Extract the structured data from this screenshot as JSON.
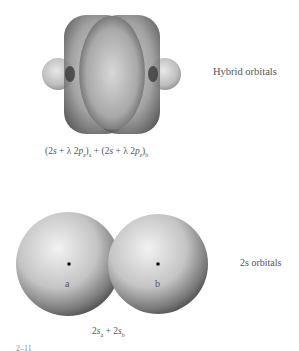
{
  "hybrid": {
    "label": "Hybrid orbitals",
    "formula": {
      "part1": "(2",
      "s1": "s",
      "plus1": " + λ 2",
      "p1": "p",
      "p1sub": "z",
      "close1": ")",
      "sub1": "a",
      "mid": " + (2",
      "s2": "s",
      "plus2": " + λ 2",
      "p2": "p",
      "p2sub": "z",
      "close2": ")",
      "sub2": "b"
    }
  },
  "s_orbitals": {
    "label": "2s orbitals",
    "atom_a": "a",
    "atom_b": "b",
    "formula": {
      "t1": "2",
      "s1": "s",
      "sub1": "a",
      "plus": " + 2",
      "s2": "s",
      "sub2": "b"
    }
  },
  "footer_fragment": "2–11"
}
